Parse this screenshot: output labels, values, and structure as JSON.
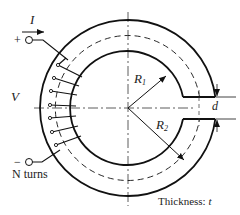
{
  "diagram": {
    "type": "toroid-with-air-gap",
    "labels": {
      "current": "I",
      "plus": "+",
      "minus": "−",
      "voltage": "V",
      "turns": "N turns",
      "r1": "R",
      "r1_sub": "1",
      "r2": "R",
      "r2_sub": "2",
      "gap": "d",
      "thickness_label": "Thickness: ",
      "thickness_var": "t"
    },
    "colors": {
      "stroke": "#111111",
      "text": "#222222",
      "background": "#ffffff"
    }
  }
}
